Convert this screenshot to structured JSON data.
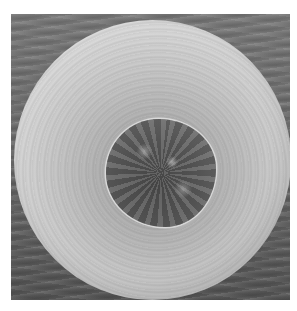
{
  "image": {
    "description": "Grayscale scanning electron micrograph of a spherical particle with a dark irregular central spot on a textured gray background",
    "colors": {
      "background_surface": "#6c6c6c",
      "sphere_rim": "#f2f2f2",
      "sphere_inner": "#a8a8a8",
      "central_spot": "#555555",
      "page": "#ffffff"
    }
  }
}
